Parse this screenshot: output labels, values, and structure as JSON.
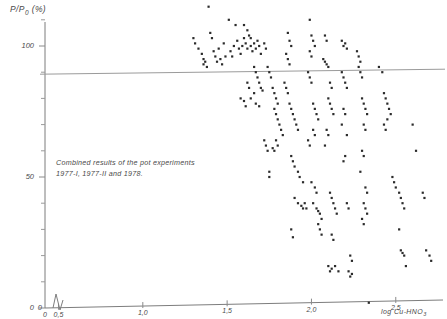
{
  "chart_data": {
    "type": "scatter",
    "title": "",
    "subtitle": "",
    "xlabel": "log Cu-HNO3",
    "xlabel_base": "log Cu-HNO",
    "xlabel_sub": "3",
    "ylabel": "P/P0 (%)",
    "ylabel_base_a": "P/P",
    "ylabel_sub": "0",
    "ylabel_base_b": " (%)",
    "annotation_line1": "Combined results of the pot experiments",
    "annotation_line2": "1977-I, 1977-II and 1978.",
    "grid": false,
    "legend": "none",
    "xlim": [
      0.42,
      2.78
    ],
    "ylim": [
      0,
      118
    ],
    "axis_break": true,
    "axis_break_note": "zigzag break between 0 and 0.5 on x-axis",
    "x_origin_label": "0",
    "y_origin_label": "0",
    "xticks": [
      0.5,
      1.0,
      1.5,
      2.0,
      2.5
    ],
    "xtick_labels": [
      "0,5",
      "1,0",
      "1,5",
      "2,0",
      "2,5"
    ],
    "yticks": [
      0,
      50,
      100
    ],
    "ytick_labels": [
      "0",
      "50",
      "100"
    ],
    "y_minor_ticks": [
      10,
      20,
      30,
      40,
      60,
      70,
      80,
      90,
      110
    ],
    "reference_lines": [
      {
        "orientation": "horizontal",
        "value": 90,
        "label": ""
      }
    ],
    "series": [
      {
        "name": "pot experiments 1977-I, 1977-II, 1978",
        "marker": "dot",
        "color": "#2b2b2b",
        "points": [
          [
            1.39,
            115
          ],
          [
            1.3,
            103
          ],
          [
            1.31,
            101
          ],
          [
            1.33,
            99
          ],
          [
            1.35,
            97
          ],
          [
            1.36,
            95
          ],
          [
            1.36,
            93
          ],
          [
            1.37,
            94
          ],
          [
            1.38,
            92
          ],
          [
            1.4,
            105
          ],
          [
            1.41,
            103
          ],
          [
            1.42,
            98
          ],
          [
            1.43,
            96
          ],
          [
            1.44,
            94
          ],
          [
            1.45,
            99
          ],
          [
            1.46,
            95
          ],
          [
            1.47,
            93
          ],
          [
            1.48,
            101
          ],
          [
            1.49,
            96
          ],
          [
            1.51,
            110
          ],
          [
            1.52,
            98
          ],
          [
            1.53,
            96
          ],
          [
            1.54,
            100
          ],
          [
            1.55,
            108
          ],
          [
            1.56,
            102
          ],
          [
            1.57,
            99
          ],
          [
            1.58,
            97
          ],
          [
            1.59,
            100
          ],
          [
            1.6,
            103
          ],
          [
            1.61,
            101
          ],
          [
            1.62,
            99
          ],
          [
            1.63,
            104
          ],
          [
            1.64,
            100
          ],
          [
            1.65,
            98
          ],
          [
            1.66,
            101
          ],
          [
            1.67,
            99
          ],
          [
            1.68,
            102
          ],
          [
            1.69,
            100
          ],
          [
            1.7,
            97
          ],
          [
            1.6,
            108
          ],
          [
            1.62,
            106
          ],
          [
            1.64,
            103
          ],
          [
            1.66,
            92
          ],
          [
            1.67,
            90
          ],
          [
            1.68,
            88
          ],
          [
            1.69,
            86
          ],
          [
            1.7,
            84
          ],
          [
            1.71,
            83
          ],
          [
            1.66,
            82
          ],
          [
            1.64,
            80
          ],
          [
            1.67,
            78
          ],
          [
            1.69,
            77
          ],
          [
            1.62,
            86
          ],
          [
            1.63,
            84
          ],
          [
            1.58,
            80
          ],
          [
            1.6,
            79
          ],
          [
            1.61,
            77
          ],
          [
            1.72,
            101
          ],
          [
            1.73,
            99
          ],
          [
            1.74,
            92
          ],
          [
            1.75,
            90
          ],
          [
            1.76,
            88
          ],
          [
            1.77,
            84
          ],
          [
            1.78,
            82
          ],
          [
            1.79,
            80
          ],
          [
            1.8,
            78
          ],
          [
            1.78,
            76
          ],
          [
            1.79,
            74
          ],
          [
            1.8,
            72
          ],
          [
            1.81,
            70
          ],
          [
            1.82,
            68
          ],
          [
            1.83,
            66
          ],
          [
            1.79,
            64
          ],
          [
            1.8,
            62
          ],
          [
            1.77,
            61
          ],
          [
            1.78,
            60
          ],
          [
            1.72,
            64
          ],
          [
            1.73,
            62
          ],
          [
            1.74,
            60
          ],
          [
            1.75,
            52
          ],
          [
            1.75,
            50
          ],
          [
            1.86,
            105
          ],
          [
            1.87,
            102
          ],
          [
            1.88,
            100
          ],
          [
            1.85,
            97
          ],
          [
            1.86,
            95
          ],
          [
            1.87,
            93
          ],
          [
            1.84,
            86
          ],
          [
            1.85,
            84
          ],
          [
            1.86,
            82
          ],
          [
            1.87,
            78
          ],
          [
            1.88,
            76
          ],
          [
            1.89,
            74
          ],
          [
            1.9,
            72
          ],
          [
            1.91,
            70
          ],
          [
            1.92,
            68
          ],
          [
            1.88,
            58
          ],
          [
            1.89,
            56
          ],
          [
            1.9,
            54
          ],
          [
            1.92,
            52
          ],
          [
            1.93,
            50
          ],
          [
            1.95,
            48
          ],
          [
            1.9,
            42
          ],
          [
            1.92,
            40
          ],
          [
            1.94,
            39
          ],
          [
            1.95,
            38
          ],
          [
            1.96,
            40
          ],
          [
            1.97,
            38
          ],
          [
            1.88,
            30
          ],
          [
            1.89,
            27
          ],
          [
            1.99,
            110
          ],
          [
            2.0,
            104
          ],
          [
            2.01,
            102
          ],
          [
            2.02,
            100
          ],
          [
            1.99,
            98
          ],
          [
            2.0,
            96
          ],
          [
            1.98,
            90
          ],
          [
            1.99,
            88
          ],
          [
            2.0,
            86
          ],
          [
            2.01,
            78
          ],
          [
            2.02,
            76
          ],
          [
            2.03,
            74
          ],
          [
            2.04,
            72
          ],
          [
            2.01,
            68
          ],
          [
            2.02,
            66
          ],
          [
            1.98,
            64
          ],
          [
            1.99,
            62
          ],
          [
            2.0,
            48
          ],
          [
            2.02,
            46
          ],
          [
            2.03,
            44
          ],
          [
            2.01,
            40
          ],
          [
            2.03,
            38
          ],
          [
            2.04,
            37
          ],
          [
            2.05,
            36
          ],
          [
            2.06,
            34
          ],
          [
            2.04,
            32
          ],
          [
            2.05,
            30
          ],
          [
            2.06,
            28
          ],
          [
            2.08,
            104
          ],
          [
            2.09,
            102
          ],
          [
            2.07,
            95
          ],
          [
            2.08,
            94
          ],
          [
            2.09,
            93
          ],
          [
            2.1,
            92
          ],
          [
            2.11,
            86
          ],
          [
            2.12,
            84
          ],
          [
            2.1,
            80
          ],
          [
            2.11,
            78
          ],
          [
            2.12,
            76
          ],
          [
            2.13,
            74
          ],
          [
            2.09,
            68
          ],
          [
            2.1,
            66
          ],
          [
            2.08,
            62
          ],
          [
            2.11,
            44
          ],
          [
            2.12,
            42
          ],
          [
            2.13,
            40
          ],
          [
            2.14,
            38
          ],
          [
            2.15,
            36
          ],
          [
            2.12,
            28
          ],
          [
            2.13,
            26
          ],
          [
            2.1,
            16
          ],
          [
            2.11,
            14
          ],
          [
            2.12,
            15
          ],
          [
            2.14,
            16
          ],
          [
            2.16,
            14
          ],
          [
            2.18,
            102
          ],
          [
            2.19,
            100
          ],
          [
            2.2,
            101
          ],
          [
            2.21,
            99
          ],
          [
            2.18,
            90
          ],
          [
            2.19,
            88
          ],
          [
            2.2,
            86
          ],
          [
            2.21,
            84
          ],
          [
            2.19,
            76
          ],
          [
            2.2,
            74
          ],
          [
            2.18,
            70
          ],
          [
            2.21,
            66
          ],
          [
            2.2,
            58
          ],
          [
            2.19,
            56
          ],
          [
            2.21,
            40
          ],
          [
            2.22,
            38
          ],
          [
            2.23,
            20
          ],
          [
            2.24,
            18
          ],
          [
            2.22,
            14
          ],
          [
            2.23,
            12
          ],
          [
            2.24,
            13
          ],
          [
            2.27,
            98
          ],
          [
            2.28,
            96
          ],
          [
            2.29,
            90
          ],
          [
            2.3,
            88
          ],
          [
            2.28,
            92
          ],
          [
            2.29,
            94
          ],
          [
            2.3,
            80
          ],
          [
            2.31,
            78
          ],
          [
            2.32,
            76
          ],
          [
            2.33,
            74
          ],
          [
            2.31,
            70
          ],
          [
            2.32,
            68
          ],
          [
            2.3,
            60
          ],
          [
            2.31,
            58
          ],
          [
            2.29,
            52
          ],
          [
            2.32,
            46
          ],
          [
            2.33,
            44
          ],
          [
            2.31,
            40
          ],
          [
            2.32,
            38
          ],
          [
            2.33,
            36
          ],
          [
            2.3,
            34
          ],
          [
            2.31,
            32
          ],
          [
            2.34,
            2
          ],
          [
            2.4,
            92
          ],
          [
            2.42,
            90
          ],
          [
            2.43,
            82
          ],
          [
            2.44,
            80
          ],
          [
            2.45,
            78
          ],
          [
            2.46,
            76
          ],
          [
            2.47,
            74
          ],
          [
            2.43,
            70
          ],
          [
            2.44,
            68
          ],
          [
            2.45,
            72
          ],
          [
            2.48,
            50
          ],
          [
            2.49,
            48
          ],
          [
            2.5,
            46
          ],
          [
            2.52,
            44
          ],
          [
            2.53,
            42
          ],
          [
            2.54,
            40
          ],
          [
            2.55,
            38
          ],
          [
            2.52,
            30
          ],
          [
            2.53,
            22
          ],
          [
            2.54,
            21
          ],
          [
            2.55,
            20
          ],
          [
            2.56,
            16
          ],
          [
            2.6,
            70
          ],
          [
            2.62,
            60
          ],
          [
            2.66,
            44
          ],
          [
            2.67,
            42
          ],
          [
            2.68,
            22
          ],
          [
            2.7,
            20
          ],
          [
            2.71,
            18
          ]
        ]
      }
    ]
  }
}
